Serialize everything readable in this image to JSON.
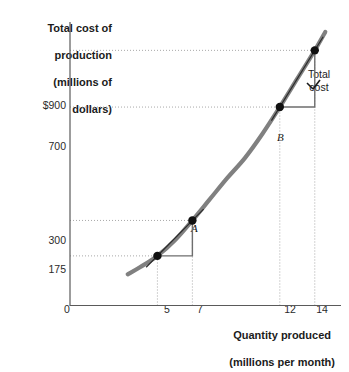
{
  "chart_data": {
    "type": "line",
    "title": "",
    "ylabel": "Total cost of production (millions of dollars)",
    "ylabel_lines": [
      "Total cost of",
      "production",
      "(millions of",
      "dollars)"
    ],
    "xlabel": "Quantity produced (millions per month)",
    "xlabel_lines": [
      "Quantity produced",
      "(millions per month)"
    ],
    "origin_label": "0",
    "xlim": [
      0,
      15.5
    ],
    "ylim": [
      0,
      1000
    ],
    "x_ticks": [
      {
        "value": 5,
        "label": "5"
      },
      {
        "value": 7,
        "label": "7"
      },
      {
        "value": 12,
        "label": "12"
      },
      {
        "value": 14,
        "label": "14"
      }
    ],
    "y_ticks": [
      {
        "value": 175,
        "label": "175"
      },
      {
        "value": 300,
        "label": "300"
      },
      {
        "value": 700,
        "label": "700"
      },
      {
        "value": 900,
        "label": "$900"
      }
    ],
    "grid": "dotted-to-points",
    "series": [
      {
        "name": "Total cost",
        "label": "Total cost",
        "label_lines": [
          "Total",
          "cost"
        ],
        "color": "#808080",
        "x": [
          3.3,
          4.0,
          5.0,
          6.0,
          7.0,
          8.0,
          9.0,
          10.0,
          11.0,
          12.0,
          13.0,
          14.0,
          14.6
        ],
        "y": [
          110,
          135,
          175,
          230,
          300,
          375,
          450,
          520,
          605,
          700,
          800,
          900,
          965
        ]
      }
    ],
    "points": [
      {
        "label": "A",
        "x": 5,
        "y": 175
      },
      {
        "label": "A",
        "x": 7,
        "y": 300
      },
      {
        "label": "B",
        "x": 12,
        "y": 700
      },
      {
        "label": "",
        "x": 14,
        "y": 900
      }
    ],
    "labeled_points": [
      {
        "label": "A",
        "x": 7,
        "y": 300
      },
      {
        "label": "B",
        "x": 12,
        "y": 700
      }
    ],
    "slope_triangles": [
      {
        "from_x": 5,
        "from_y": 175,
        "to_x": 7,
        "to_y": 300
      },
      {
        "from_x": 12,
        "from_y": 700,
        "to_x": 14,
        "to_y": 900
      }
    ],
    "annotations": []
  }
}
